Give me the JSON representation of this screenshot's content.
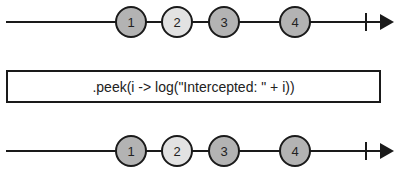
{
  "diagram": {
    "type": "marble-diagram",
    "colors": {
      "line": "#1a1a1a",
      "marble_dark": "#b3b3b3",
      "marble_light": "#e2e2e2",
      "stroke": "#1a1a1a"
    },
    "input_stream": {
      "y": 22,
      "marbles": [
        {
          "label": "1",
          "x": 131,
          "shade": "dark"
        },
        {
          "label": "2",
          "x": 177,
          "shade": "light"
        },
        {
          "label": "3",
          "x": 224,
          "shade": "dark"
        },
        {
          "label": "4",
          "x": 295,
          "shade": "dark"
        }
      ],
      "completion_tick_x": 366
    },
    "operator": {
      "label": ".peek(i -> log(\"Intercepted: \" + i))"
    },
    "output_stream": {
      "y": 151,
      "marbles": [
        {
          "label": "1",
          "x": 131,
          "shade": "dark"
        },
        {
          "label": "2",
          "x": 177,
          "shade": "light"
        },
        {
          "label": "3",
          "x": 224,
          "shade": "dark"
        },
        {
          "label": "4",
          "x": 295,
          "shade": "dark"
        }
      ],
      "completion_tick_x": 366
    }
  }
}
